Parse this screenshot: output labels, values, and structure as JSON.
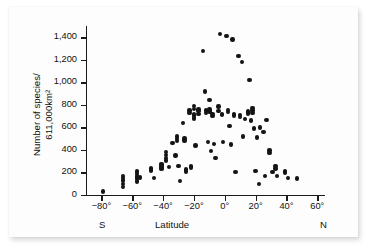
{
  "figure": {
    "background_color": "#fdfdfd",
    "point_color": "#141414",
    "axis_color": "#1a1a1a"
  },
  "chart_data": {
    "type": "scatter",
    "title": "",
    "xlabel": "Latitude",
    "ylabel": "Number of species/\n611,000km²",
    "xlim": [
      -90,
      65
    ],
    "ylim": [
      0,
      1500
    ],
    "grid": false,
    "legend": null,
    "x_tick_labels": [
      "−80°",
      "−60°",
      "−40°",
      "−20°",
      "0°",
      "20°",
      "40°",
      "60°"
    ],
    "x_tick_values": [
      -80,
      -60,
      -40,
      -20,
      0,
      20,
      40,
      60
    ],
    "y_tick_labels": [
      "0",
      "200",
      "400",
      "600",
      "800",
      "1,000",
      "1,200",
      "1,400"
    ],
    "y_tick_values": [
      0,
      200,
      400,
      600,
      800,
      1000,
      1200,
      1400
    ],
    "axis_end_labels": {
      "left": "S",
      "right": "N"
    },
    "points": [
      [
        -79,
        30
      ],
      [
        -66,
        170
      ],
      [
        -66,
        150
      ],
      [
        -66,
        130
      ],
      [
        -66,
        95
      ],
      [
        -66,
        70
      ],
      [
        -57,
        215
      ],
      [
        -57,
        205
      ],
      [
        -57,
        185
      ],
      [
        -57,
        165
      ],
      [
        -57,
        145
      ],
      [
        -57,
        120
      ],
      [
        -55,
        155
      ],
      [
        -48,
        235
      ],
      [
        -48,
        225
      ],
      [
        -48,
        215
      ],
      [
        -46,
        150
      ],
      [
        -41,
        275
      ],
      [
        -41,
        265
      ],
      [
        -41,
        250
      ],
      [
        -41,
        240
      ],
      [
        -41,
        230
      ],
      [
        -38,
        380
      ],
      [
        -38,
        355
      ],
      [
        -38,
        330
      ],
      [
        -38,
        305
      ],
      [
        -36,
        250
      ],
      [
        -34,
        460
      ],
      [
        -32,
        350
      ],
      [
        -31,
        520
      ],
      [
        -31,
        495
      ],
      [
        -31,
        480
      ],
      [
        -30,
        255
      ],
      [
        -29,
        125
      ],
      [
        -27,
        640
      ],
      [
        -26,
        500
      ],
      [
        -26,
        485
      ],
      [
        -25,
        225
      ],
      [
        -25,
        210
      ],
      [
        -23,
        750
      ],
      [
        -23,
        730
      ],
      [
        -22,
        260
      ],
      [
        -22,
        245
      ],
      [
        -20,
        790
      ],
      [
        -20,
        765
      ],
      [
        -20,
        720
      ],
      [
        -20,
        705
      ],
      [
        -20,
        680
      ],
      [
        -19,
        440
      ],
      [
        -17,
        760
      ],
      [
        -17,
        745
      ],
      [
        -17,
        720
      ],
      [
        -14,
        1280
      ],
      [
        -13,
        920
      ],
      [
        -12,
        750
      ],
      [
        -12,
        730
      ],
      [
        -11,
        470
      ],
      [
        -10,
        845
      ],
      [
        -10,
        760
      ],
      [
        -10,
        740
      ],
      [
        -9,
        390
      ],
      [
        -8,
        720
      ],
      [
        -8,
        700
      ],
      [
        -7,
        455
      ],
      [
        -6,
        330
      ],
      [
        -4,
        785
      ],
      [
        -4,
        745
      ],
      [
        -3,
        1430
      ],
      [
        -2,
        720
      ],
      [
        -2,
        710
      ],
      [
        -1,
        470
      ],
      [
        1,
        1410
      ],
      [
        2,
        755
      ],
      [
        2,
        735
      ],
      [
        3,
        615
      ],
      [
        4,
        450
      ],
      [
        5,
        1380
      ],
      [
        6,
        720
      ],
      [
        6,
        705
      ],
      [
        7,
        205
      ],
      [
        9,
        1235
      ],
      [
        10,
        710
      ],
      [
        10,
        690
      ],
      [
        11,
        1180
      ],
      [
        12,
        520
      ],
      [
        13,
        675
      ],
      [
        15,
        740
      ],
      [
        15,
        725
      ],
      [
        16,
        1020
      ],
      [
        17,
        660
      ],
      [
        18,
        770
      ],
      [
        18,
        750
      ],
      [
        18,
        730
      ],
      [
        19,
        590
      ],
      [
        20,
        215
      ],
      [
        21,
        510
      ],
      [
        22,
        100
      ],
      [
        23,
        600
      ],
      [
        25,
        560
      ],
      [
        26,
        170
      ],
      [
        27,
        665
      ],
      [
        29,
        395
      ],
      [
        29,
        375
      ],
      [
        31,
        205
      ],
      [
        33,
        255
      ],
      [
        33,
        235
      ],
      [
        34,
        170
      ],
      [
        39,
        215
      ],
      [
        39,
        200
      ],
      [
        41,
        150
      ],
      [
        47,
        145
      ]
    ]
  }
}
